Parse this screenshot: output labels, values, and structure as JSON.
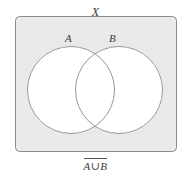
{
  "figure": {
    "type": "venn-diagram",
    "title_label": "X",
    "caption": "A∪B",
    "caption_has_overline": true,
    "colors": {
      "universe_fill": "#e9e9e9",
      "universe_stroke": "#8c8c8c",
      "circle_fill": "#ffffff",
      "circle_stroke": "#8a8a8a",
      "text": "#3a3a3a",
      "page_background": "#ffffff"
    },
    "universe": {
      "label": "X",
      "shape": "rounded-rectangle",
      "x": 15,
      "y": 16,
      "width": 162,
      "height": 136,
      "corner_radius": 4,
      "shaded": true
    },
    "sets": [
      {
        "label": "A",
        "shape": "circle",
        "cx": 71,
        "cy": 90,
        "r": 44,
        "filled": false
      },
      {
        "label": "B",
        "shape": "circle",
        "cx": 119,
        "cy": 90,
        "r": 44,
        "filled": false
      }
    ],
    "shaded_region_description": "complement of A union B"
  }
}
